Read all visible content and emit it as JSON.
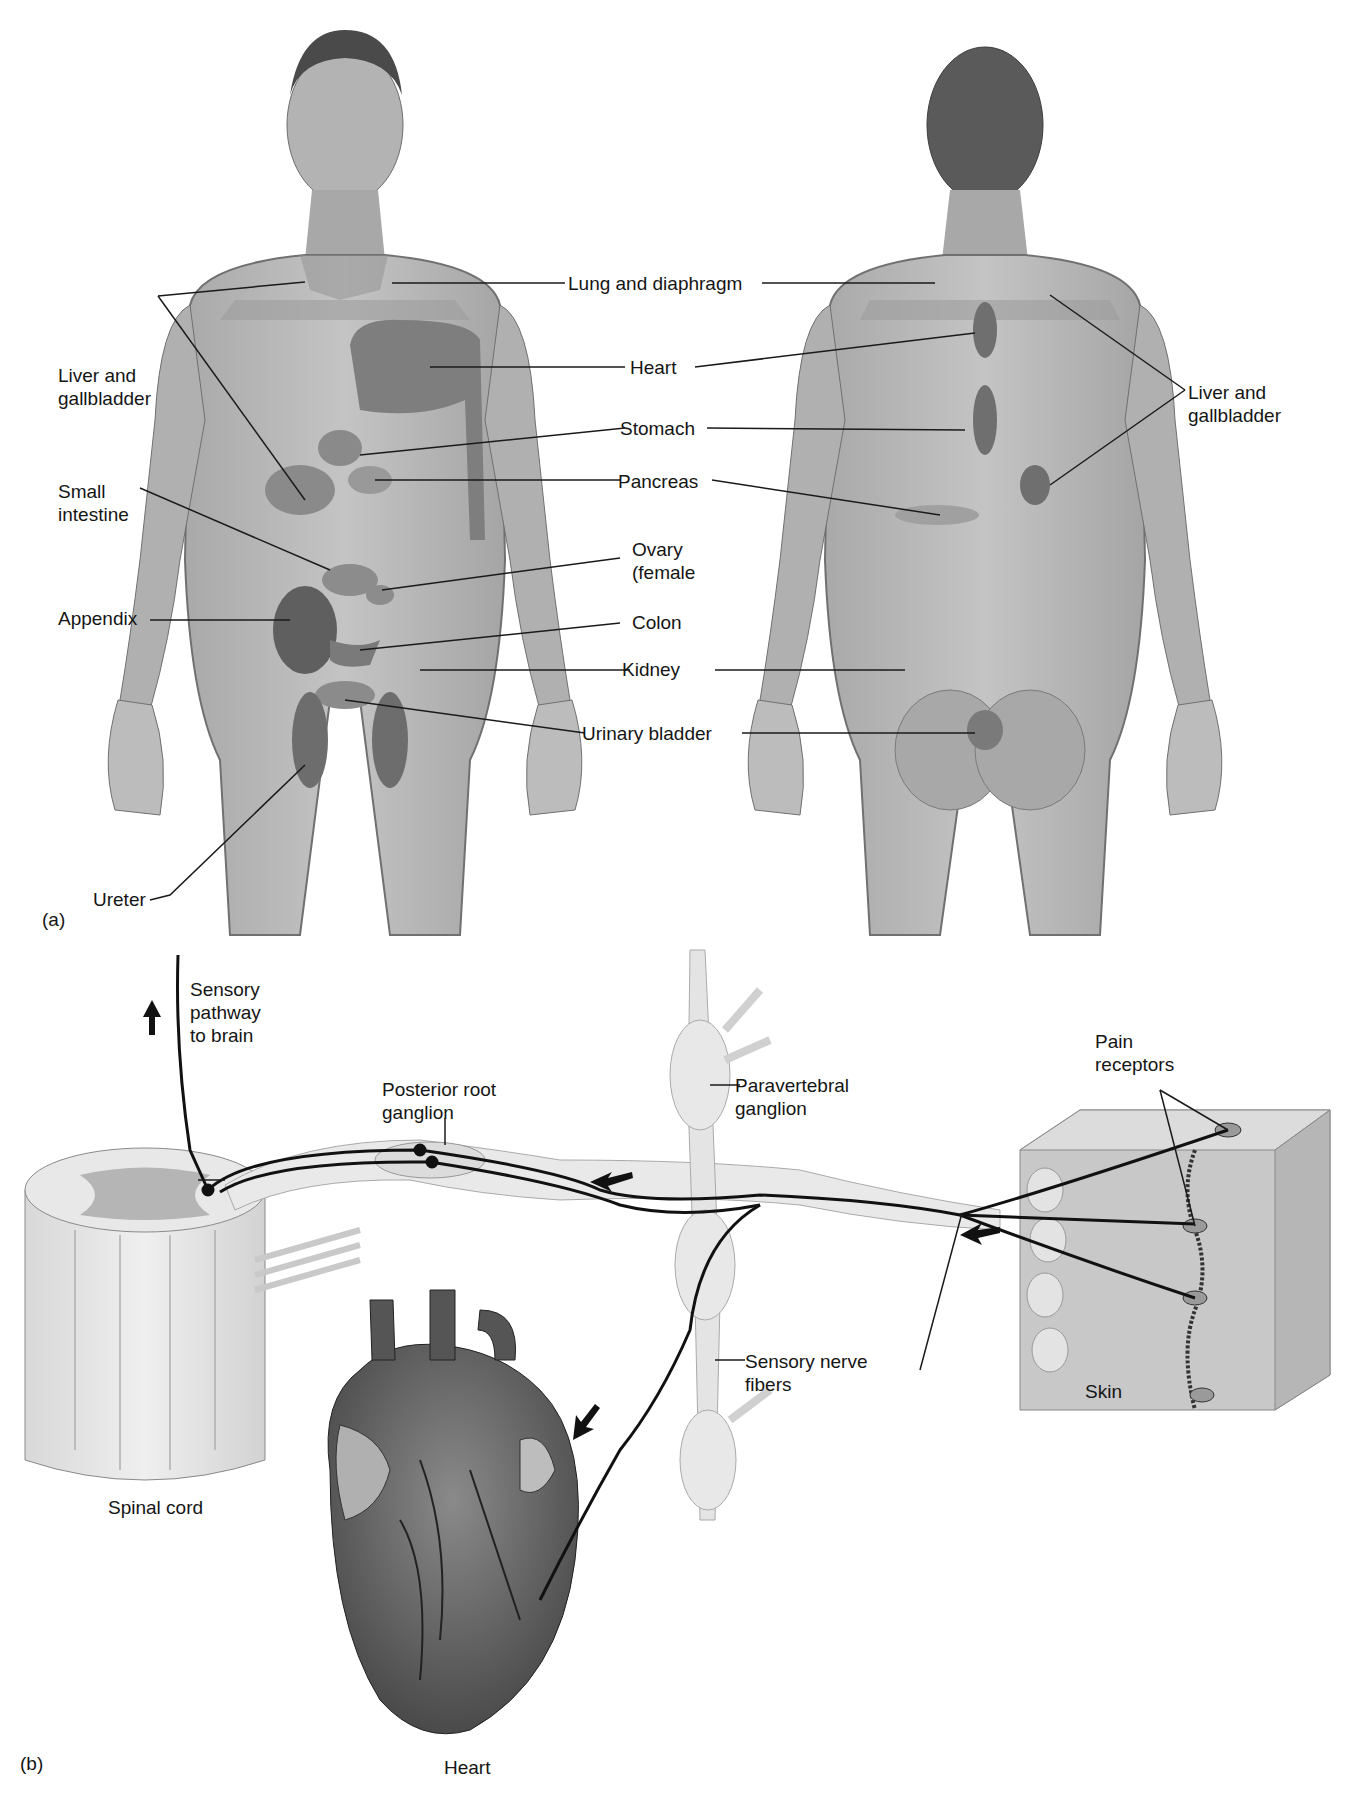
{
  "panel_a": {
    "marker": "(a)",
    "front_labels": {
      "liver_gallbladder_left": [
        "Liver and",
        "gallbladder"
      ],
      "small_intestine": [
        "Small",
        "intestine"
      ],
      "appendix": "Appendix",
      "ureter": "Ureter"
    },
    "center_labels": {
      "lung_diaphragm": "Lung and diaphragm",
      "heart": "Heart",
      "stomach": "Stomach",
      "pancreas": "Pancreas",
      "ovary": [
        "Ovary",
        "(female"
      ],
      "colon": "Colon",
      "kidney": "Kidney",
      "urinary_bladder": "Urinary bladder"
    },
    "back_labels": {
      "liver_gallbladder_right": [
        "Liver and",
        "gallbladder"
      ]
    }
  },
  "panel_b": {
    "marker": "(b)",
    "labels": {
      "sensory_pathway": [
        "Sensory",
        "pathway",
        "to brain"
      ],
      "posterior_root_ganglion": [
        "Posterior root",
        "ganglion"
      ],
      "paravertebral_ganglion": [
        "Paravertebral",
        "ganglion"
      ],
      "pain_receptors": [
        "Pain",
        "receptors"
      ],
      "sensory_nerve_fibers": [
        "Sensory nerve",
        "fibers"
      ],
      "skin": "Skin",
      "spinal_cord": "Spinal cord",
      "heart": "Heart"
    }
  },
  "colors": {
    "skin_tone": "#b9b9b9",
    "referred_zone": "#8f8f8f",
    "organ_zone": "#6e6e6e",
    "nerve": "#111111",
    "ganglion": "#e6e6e6"
  }
}
